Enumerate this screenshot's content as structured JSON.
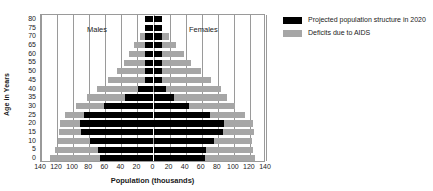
{
  "chart_data": {
    "type": "bar",
    "subtype": "population-pyramid",
    "title": "",
    "xlabel": "Population (thousands)",
    "ylabel": "Age in Years",
    "xlim": [
      -140,
      140
    ],
    "xticks": [
      140,
      120,
      100,
      80,
      60,
      40,
      20,
      0,
      20,
      40,
      60,
      80,
      100,
      120,
      140
    ],
    "xtick_labels": [
      "140",
      "120",
      "100",
      "80",
      "60",
      "40",
      "20",
      "0",
      "20",
      "40",
      "60",
      "80",
      "100",
      "120",
      "140"
    ],
    "grid": true,
    "grid_axis": "x",
    "legend_position": "right",
    "annotations": [
      {
        "text": "Males",
        "side": "left"
      },
      {
        "text": "Females",
        "side": "right"
      }
    ],
    "categories": [
      "0",
      "5",
      "10",
      "15",
      "20",
      "25",
      "30",
      "35",
      "40",
      "45",
      "50",
      "55",
      "60",
      "65",
      "70",
      "75",
      "80"
    ],
    "ytick_labels": [
      "0",
      "5",
      "10",
      "15",
      "20",
      "25",
      "30",
      "35",
      "40",
      "45",
      "50",
      "55",
      "60",
      "65",
      "70",
      "75",
      "80"
    ],
    "series": [
      {
        "name": "Projected population structure in 2020",
        "color": "#000000",
        "males": [
          66,
          69,
          79,
          90,
          91,
          86,
          61,
          36,
          19,
          11,
          11,
          11,
          11,
          11,
          11,
          11,
          11
        ],
        "females": [
          64,
          65,
          75,
          87,
          88,
          70,
          44,
          26,
          15,
          11,
          11,
          11,
          11,
          11,
          11,
          11,
          11
        ]
      },
      {
        "name": "Deficits due to AIDS",
        "color": "#a6a6a6",
        "males": [
          129,
          122,
          119,
          118,
          116,
          110,
          97,
          83,
          70,
          57,
          45,
          37,
          30,
          24,
          17,
          11,
          11
        ],
        "females": [
          126,
          124,
          122,
          125,
          124,
          114,
          101,
          92,
          84,
          72,
          59,
          47,
          38,
          28,
          19,
          11,
          11
        ]
      }
    ]
  },
  "axis": {
    "ylabel": "Age in Years",
    "xlabel": "Population (thousands)"
  },
  "annotations": {
    "males": "Males",
    "females": "Females"
  },
  "legend": {
    "items": [
      {
        "label": "Projected population structure in 2020",
        "swatch": "black"
      },
      {
        "label": "Deficits due to AIDS",
        "swatch": "grey"
      }
    ]
  },
  "colors": {
    "projected": "#000000",
    "deficit": "#a6a6a6",
    "grid": "#9a9a9a",
    "background": "#ffffff"
  }
}
